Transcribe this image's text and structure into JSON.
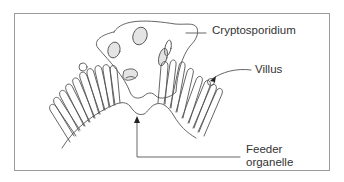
{
  "figure": {
    "type": "biological-diagram",
    "colors": {
      "line": "#555555",
      "frame": "#9a9a9a",
      "vacuole_fill": "#e4e4e4",
      "text": "#333333"
    }
  },
  "labels": {
    "cryptosporidium": "Cryptosporidium",
    "villus": "Villus",
    "feeder_line1": "Feeder",
    "feeder_line2": "organelle"
  }
}
